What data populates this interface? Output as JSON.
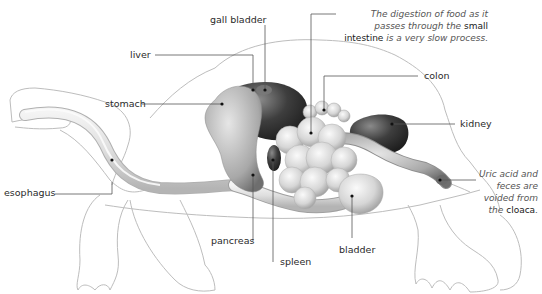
{
  "diagram": {
    "labels": {
      "gall_bladder": "gall bladder",
      "liver": "liver",
      "stomach": "stomach",
      "esophagus": "esophagus",
      "colon": "colon",
      "kidney": "kidney",
      "pancreas": "pancreas",
      "spleen": "spleen",
      "bladder": "bladder"
    },
    "notes": {
      "intestine": {
        "pre": "The digestion of food as it passes through the",
        "term": "small intestine",
        "post": "is a very slow process."
      },
      "cloaca": {
        "pre": "Uric acid and feces are voided from the",
        "term": "cloaca",
        "post": "."
      }
    },
    "colors": {
      "outline": "#b8b8b8",
      "organ_light": "#e2e2e2",
      "organ_mid": "#a9a9a9",
      "organ_dark": "#3a3a3a",
      "leader": "#555555"
    }
  }
}
